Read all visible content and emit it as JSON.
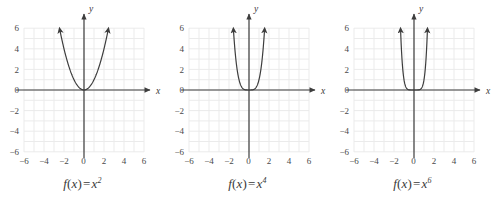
{
  "figure": {
    "title": "",
    "background_color": "#ffffff",
    "panel_count": 3
  },
  "style": {
    "grid_color": "#ebebeb",
    "axis_color": "#3d3d3d",
    "curve_color": "#3d3d3d",
    "tick_label_color": "#4a4a4a",
    "caption_color": "#3a3a3a"
  },
  "chart_data": [
    {
      "type": "line",
      "title": "",
      "caption": "f(x) = x²",
      "function": "f(x) = x^2",
      "exponent": 2,
      "xlabel": "x",
      "ylabel": "y",
      "xlim": [
        -6,
        6
      ],
      "ylim": [
        -6,
        6
      ],
      "grid": true,
      "grid_step": 1,
      "xticks": [
        -6,
        -4,
        -2,
        0,
        2,
        4,
        6
      ],
      "xtick_labels": [
        "−6",
        "−4",
        "−2",
        "0",
        "2",
        "4",
        "6"
      ],
      "yticks": [
        6,
        4,
        2,
        0,
        -2,
        -4,
        -6
      ],
      "ytick_labels": [
        "6",
        "4",
        "2",
        "0",
        "−2",
        "−4",
        "−6"
      ],
      "legend": null,
      "arrows": [
        "curve-left-end",
        "curve-right-end",
        "x-axis-right",
        "y-axis-top"
      ],
      "x": [
        -2.4,
        -2.2,
        -2.0,
        -1.8,
        -1.6,
        -1.4,
        -1.2,
        -1.0,
        -0.8,
        -0.6,
        -0.4,
        -0.2,
        0.0,
        0.2,
        0.4,
        0.6,
        0.8,
        1.0,
        1.2,
        1.4,
        1.6,
        1.8,
        2.0,
        2.2,
        2.4
      ],
      "values": [
        5.76,
        4.84,
        4.0,
        3.24,
        2.56,
        1.96,
        1.44,
        1.0,
        0.64,
        0.36,
        0.16,
        0.04,
        0.0,
        0.04,
        0.16,
        0.36,
        0.64,
        1.0,
        1.44,
        1.96,
        2.56,
        3.24,
        4.0,
        4.84,
        5.76
      ]
    },
    {
      "type": "line",
      "title": "",
      "caption": "f(x) = x⁴",
      "function": "f(x) = x^4",
      "exponent": 4,
      "xlabel": "x",
      "ylabel": "y",
      "xlim": [
        -6,
        6
      ],
      "ylim": [
        -6,
        6
      ],
      "grid": true,
      "grid_step": 1,
      "xticks": [
        -6,
        -4,
        -2,
        0,
        2,
        4,
        6
      ],
      "xtick_labels": [
        "−6",
        "−4",
        "−2",
        "0",
        "2",
        "4",
        "6"
      ],
      "yticks": [
        6,
        4,
        2,
        0,
        -2,
        -4,
        -6
      ],
      "ytick_labels": [
        "6",
        "4",
        "2",
        "0",
        "−2",
        "−4",
        "−6"
      ],
      "legend": null,
      "arrows": [
        "curve-left-end",
        "curve-right-end",
        "x-axis-right",
        "y-axis-top"
      ],
      "x": [
        -1.56,
        -1.5,
        -1.4,
        -1.3,
        -1.2,
        -1.1,
        -1.0,
        -0.9,
        -0.8,
        -0.6,
        -0.4,
        -0.2,
        0.0,
        0.2,
        0.4,
        0.6,
        0.8,
        0.9,
        1.0,
        1.1,
        1.2,
        1.3,
        1.4,
        1.5,
        1.56
      ],
      "values": [
        5.92,
        5.06,
        3.84,
        2.86,
        2.07,
        1.46,
        1.0,
        0.66,
        0.41,
        0.13,
        0.03,
        0.0016,
        0.0,
        0.0016,
        0.03,
        0.13,
        0.41,
        0.66,
        1.0,
        1.46,
        2.07,
        2.86,
        3.84,
        5.06,
        5.92
      ]
    },
    {
      "type": "line",
      "title": "",
      "caption": "f(x) = x⁶",
      "function": "f(x) = x^6",
      "exponent": 6,
      "xlabel": "x",
      "ylabel": "y",
      "xlim": [
        -6,
        6
      ],
      "ylim": [
        -6,
        6
      ],
      "grid": true,
      "grid_step": 1,
      "xticks": [
        -6,
        -4,
        -2,
        0,
        2,
        4,
        6
      ],
      "xtick_labels": [
        "−6",
        "−4",
        "−2",
        "0",
        "2",
        "4",
        "6"
      ],
      "yticks": [
        6,
        4,
        2,
        0,
        -2,
        -4,
        -6
      ],
      "ytick_labels": [
        "6",
        "4",
        "2",
        "0",
        "−2",
        "−4",
        "−6"
      ],
      "legend": null,
      "arrows": [
        "curve-left-end",
        "curve-right-end",
        "x-axis-right",
        "y-axis-top"
      ],
      "x": [
        -1.33,
        -1.3,
        -1.25,
        -1.2,
        -1.15,
        -1.1,
        -1.05,
        -1.0,
        -0.95,
        -0.9,
        -0.8,
        -0.7,
        -0.5,
        -0.3,
        0.0,
        0.3,
        0.5,
        0.7,
        0.8,
        0.9,
        0.95,
        1.0,
        1.05,
        1.1,
        1.15,
        1.2,
        1.25,
        1.3,
        1.33
      ],
      "values": [
        5.54,
        4.83,
        3.81,
        2.99,
        2.31,
        1.77,
        1.34,
        1.0,
        0.74,
        0.53,
        0.26,
        0.12,
        0.016,
        0.0007,
        0.0,
        0.0007,
        0.016,
        0.12,
        0.26,
        0.53,
        0.74,
        1.0,
        1.34,
        1.77,
        2.31,
        2.99,
        3.81,
        4.83,
        5.54
      ]
    }
  ],
  "panels": [
    {
      "id": "panel-x-squared",
      "caption_prefix": "f",
      "caption_open": "(",
      "caption_var": "x",
      "caption_close": ")",
      "caption_eq": "=",
      "caption_base": "x",
      "caption_exp": "2",
      "x_axis_label": "x",
      "y_axis_label": "y"
    },
    {
      "id": "panel-x-fourth",
      "caption_prefix": "f",
      "caption_open": "(",
      "caption_var": "x",
      "caption_close": ")",
      "caption_eq": "=",
      "caption_base": "x",
      "caption_exp": "4",
      "x_axis_label": "x",
      "y_axis_label": "y"
    },
    {
      "id": "panel-x-sixth",
      "caption_prefix": "f",
      "caption_open": "(",
      "caption_var": "x",
      "caption_close": ")",
      "caption_eq": "=",
      "caption_base": "x",
      "caption_exp": "6",
      "x_axis_label": "x",
      "y_axis_label": "y"
    }
  ]
}
